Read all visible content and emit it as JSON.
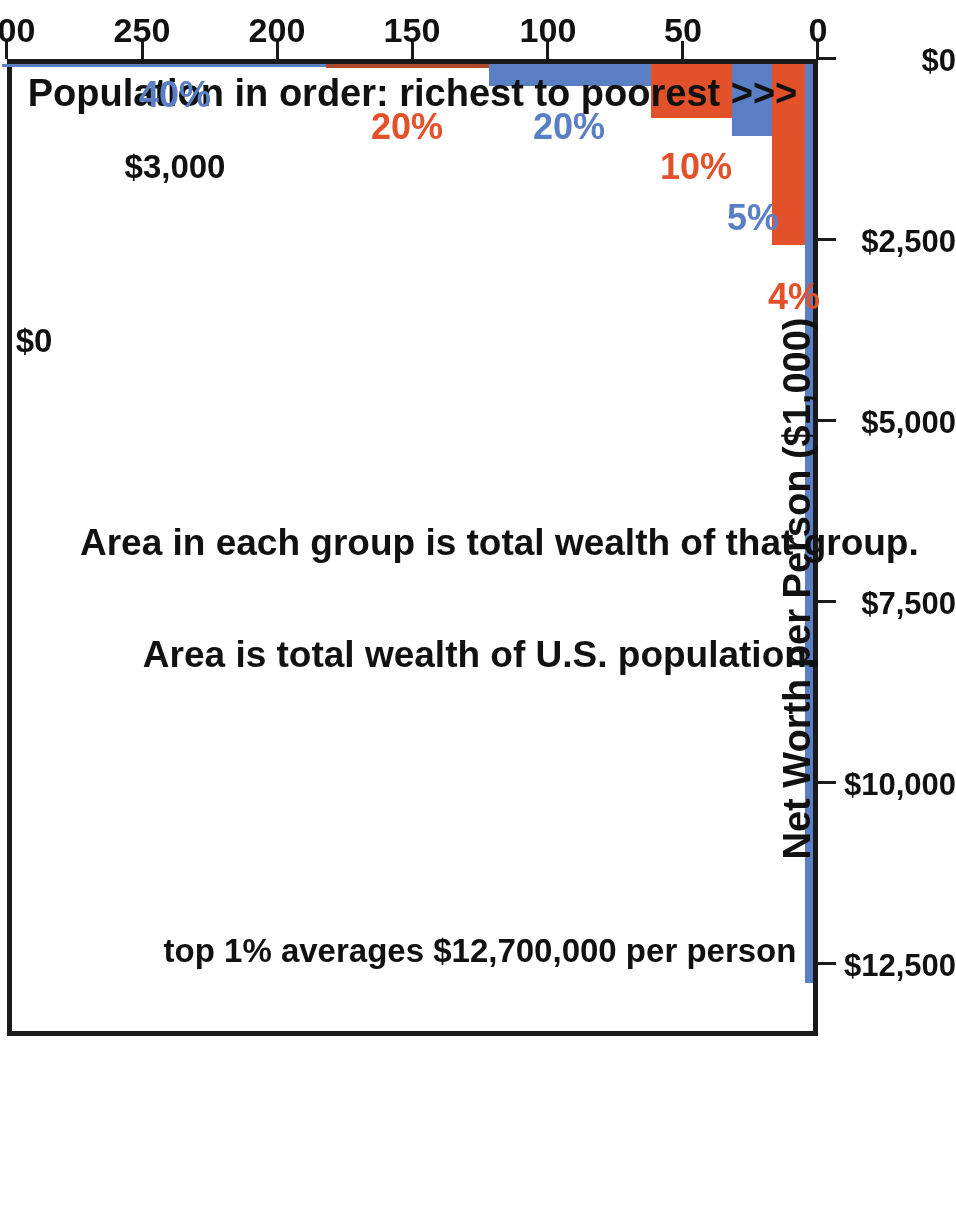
{
  "chart_data": {
    "type": "bar",
    "title": "",
    "xlabel": "Population in order: richest to poorest >>>",
    "ylabel": "Net Worth per Person ($1,000)",
    "xlim": [
      0,
      300
    ],
    "ylim": [
      0,
      13500
    ],
    "xticks": [
      "0",
      "50",
      "100",
      "150",
      "200",
      "250",
      "300"
    ],
    "xtick_values": [
      0,
      50,
      100,
      150,
      200,
      250,
      300
    ],
    "yticks": [
      "$0",
      "$2,500",
      "$5,000",
      "$7,500",
      "$10,000",
      "$12,500"
    ],
    "ytick_values": [
      0,
      2500,
      5000,
      7500,
      10000,
      12500
    ],
    "grid": false,
    "legend": "none",
    "units_note": "x = population in millions, y = net worth per person in $1,000s",
    "bars": [
      {
        "group": "1%",
        "x_start": 0,
        "x_end": 3,
        "value": 12700,
        "color": "#5B7FC4",
        "label": ""
      },
      {
        "group": "4%",
        "x_start": 3,
        "x_end": 15,
        "value": 2500,
        "color": "#E3512A",
        "label": "4%"
      },
      {
        "group": "5%",
        "x_start": 15,
        "x_end": 30,
        "value": 1000,
        "color": "#5B7FC4",
        "label": "5%"
      },
      {
        "group": "10%",
        "x_start": 30,
        "x_end": 60,
        "value": 750,
        "color": "#E3512A",
        "label": "10%"
      },
      {
        "group": "20%",
        "x_start": 60,
        "x_end": 120,
        "value": 300,
        "color": "#5B7FC4",
        "label": "20%"
      },
      {
        "group": "20%",
        "x_start": 120,
        "x_end": 180,
        "value": 60,
        "color": "#B04A2E",
        "label": "20%"
      },
      {
        "group": "40%",
        "x_start": 180,
        "x_end": 300,
        "value": 3,
        "color": "#5B7FC4",
        "label": "40%"
      }
    ],
    "annotations": [
      {
        "name": "top-one-percent-note",
        "text": "top 1% averages $12,700,000 per person"
      },
      {
        "name": "area-total-wealth-note",
        "text": "Area is total wealth of U.S. population."
      },
      {
        "name": "area-group-wealth-note",
        "text": "Area in each group is total wealth of that group."
      }
    ],
    "value_labels": [
      {
        "name": "forty-percent-value",
        "text": "$3,000"
      },
      {
        "name": "remainder-value",
        "text": "$0"
      }
    ],
    "colors": {
      "blue": "#5B7FC4",
      "red": "#E3512A",
      "dark_red": "#B04A2E",
      "axis": "#1a1a1a"
    }
  }
}
